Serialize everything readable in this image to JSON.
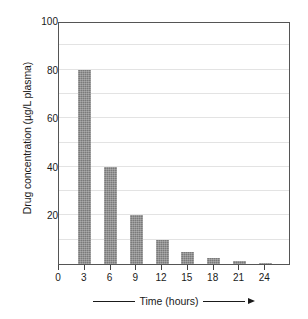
{
  "chart_data": {
    "type": "bar",
    "title": "",
    "subtitle": "",
    "xlabel": "Time (hours)",
    "ylabel": "Drug concentration (µg/L plasma)",
    "categories": [
      "0",
      "3",
      "6",
      "9",
      "12",
      "15",
      "18",
      "21",
      "24"
    ],
    "x": [
      0,
      3,
      6,
      9,
      12,
      15,
      18,
      21,
      24
    ],
    "values": [
      0,
      80,
      40,
      20,
      10,
      5,
      2.5,
      1.25,
      0.6
    ],
    "series": [
      {
        "name": "Drug concentration",
        "values": [
          0,
          80,
          40,
          20,
          10,
          5,
          2.5,
          1.25,
          0.6
        ]
      }
    ],
    "bars": [
      {
        "category": "0",
        "value": 0
      },
      {
        "category": "3",
        "value": 80
      },
      {
        "category": "6",
        "value": 40
      },
      {
        "category": "9",
        "value": 20
      },
      {
        "category": "12",
        "value": 10
      },
      {
        "category": "15",
        "value": 5
      },
      {
        "category": "18",
        "value": 2.5
      },
      {
        "category": "21",
        "value": 1.25
      },
      {
        "category": "24",
        "value": 0.6
      }
    ],
    "xlim": [
      0,
      27
    ],
    "ylim": [
      0,
      100
    ],
    "ytick_values": [
      0,
      10,
      20,
      30,
      40,
      50,
      60,
      70,
      80,
      90,
      100
    ],
    "ytick_labels_major": [
      "20",
      "40",
      "60",
      "80",
      "100"
    ],
    "ytick_major_values": [
      20,
      40,
      60,
      80,
      100
    ],
    "ytick_minor_values": [
      10,
      30,
      50,
      70,
      90
    ],
    "xtick_labels": [
      "0",
      "3",
      "6",
      "9",
      "12",
      "15",
      "18",
      "21",
      "24"
    ],
    "grid": true,
    "grid_axis": "y",
    "legend": false,
    "legend_position": "none",
    "annotations": [],
    "colors": {
      "bar_fill": "#7a7a7a",
      "gridline": "#e3e3e3",
      "axis": "#555555",
      "text": "#1a1a1a",
      "background": "#ffffff"
    }
  },
  "axes": {
    "y_title": "Drug concentration (µg/L plasma)",
    "x_title": "Time (hours)",
    "y_labels": [
      {
        "value": 100,
        "text": "100"
      },
      {
        "value": 80,
        "text": "80"
      },
      {
        "value": 60,
        "text": "60"
      },
      {
        "value": 40,
        "text": "40"
      },
      {
        "value": 20,
        "text": "20"
      }
    ],
    "x_labels": [
      {
        "value": 0,
        "text": "0"
      },
      {
        "value": 3,
        "text": "3"
      },
      {
        "value": 6,
        "text": "6"
      },
      {
        "value": 9,
        "text": "9"
      },
      {
        "value": 12,
        "text": "12"
      },
      {
        "value": 15,
        "text": "15"
      },
      {
        "value": 18,
        "text": "18"
      },
      {
        "value": 21,
        "text": "21"
      },
      {
        "value": 24,
        "text": "24"
      }
    ]
  }
}
